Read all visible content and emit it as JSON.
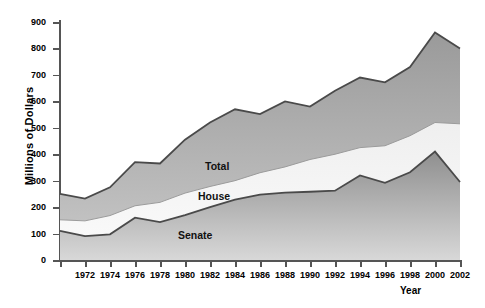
{
  "chart_data": {
    "type": "area",
    "title": "",
    "xlabel": "Year",
    "ylabel": "Millions of Dollars",
    "ylim": [
      0,
      900
    ],
    "xlim": [
      1970,
      2002
    ],
    "ytick_step": 100,
    "grid": false,
    "legend_position": "inline-labels",
    "stacked": true,
    "x": [
      1970,
      1972,
      1974,
      1976,
      1978,
      1980,
      1982,
      1984,
      1986,
      1988,
      1990,
      1992,
      1994,
      1996,
      1998,
      2000,
      2002
    ],
    "yticks": [
      0,
      100,
      200,
      300,
      400,
      500,
      600,
      700,
      800,
      900
    ],
    "xticks": [
      1970,
      1972,
      1974,
      1976,
      1978,
      1980,
      1982,
      1984,
      1986,
      1988,
      1990,
      1992,
      1994,
      1996,
      1998,
      2000,
      2002
    ],
    "xtick_labels": [
      "",
      "1972",
      "1974",
      "1976",
      "1978",
      "1980",
      "1982",
      "1984",
      "1986",
      "1988",
      "1990",
      "1992",
      "1994",
      "1996",
      "1998",
      "2000",
      "2002"
    ],
    "series": [
      {
        "name": "Senate",
        "label": "Senate",
        "color": "#8c8c8c",
        "cumulative": [
          110,
          90,
          97,
          160,
          143,
          170,
          200,
          228,
          247,
          255,
          258,
          262,
          320,
          292,
          332,
          410,
          295
        ]
      },
      {
        "name": "House",
        "label": "House",
        "color": "#e2e2e2",
        "cumulative": [
          152,
          148,
          168,
          205,
          218,
          253,
          278,
          300,
          330,
          352,
          380,
          400,
          425,
          432,
          470,
          520,
          515
        ]
      },
      {
        "name": "Total",
        "label": "Total",
        "color": "#a8a8a8",
        "cumulative": [
          250,
          232,
          275,
          370,
          365,
          455,
          520,
          570,
          552,
          600,
          580,
          640,
          690,
          672,
          730,
          860,
          800
        ]
      }
    ]
  },
  "axes": {
    "y_title": "Millions of Dollars",
    "x_title": "Year"
  },
  "labels": {
    "total": "Total",
    "house": "House",
    "senate": "Senate"
  }
}
